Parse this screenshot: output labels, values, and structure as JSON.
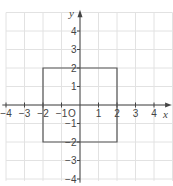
{
  "figure": {
    "type": "coordinate-grid",
    "x_axis_label": "x",
    "y_axis_label": "y",
    "origin_label": "O",
    "x_range": [
      -4,
      4
    ],
    "y_range": [
      -4,
      4
    ],
    "x_ticks": [
      "-4",
      "-3",
      "-2",
      "-1",
      "1",
      "2",
      "3",
      "4"
    ],
    "y_ticks": [
      "4",
      "3",
      "2",
      "1",
      "-1",
      "-2",
      "-3",
      "-4"
    ],
    "shape": {
      "name": "square",
      "vertices": [
        [
          -2,
          2
        ],
        [
          2,
          2
        ],
        [
          2,
          -2
        ],
        [
          -2,
          -2
        ]
      ]
    },
    "colors": {
      "grid": "#e2e2e2",
      "axis": "#444444",
      "shape": "#555555"
    }
  }
}
